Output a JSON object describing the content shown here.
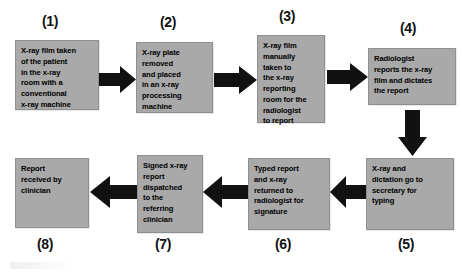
{
  "diagram": {
    "box_fill_color": "#a9a9a9",
    "box_border_color": "#8f8f8f",
    "arrow_color": "#111111",
    "background_color": "#ffffff",
    "nodes": [
      {
        "number": "(1)",
        "text": "X-ray film taken\nof the patient\nin the x-ray\nroom with a\nconventional\nx-ray machine",
        "x": 15,
        "y": 40,
        "w": 84,
        "h": 70,
        "label_x": 42,
        "label_y": 13
      },
      {
        "number": "(2)",
        "text": "X-ray plate\nremoved\nand placed\nin an x-ray\nprocessing\nmachine",
        "x": 136,
        "y": 42,
        "w": 77,
        "h": 71,
        "label_x": 160,
        "label_y": 14
      },
      {
        "number": "(3)",
        "text": "X-ray film\nmanually\ntaken to\nthe x-ray\nreporting\nroom for the\nradiologist\nto report",
        "x": 257,
        "y": 35,
        "w": 68,
        "h": 88,
        "label_x": 279,
        "label_y": 8
      },
      {
        "number": "(4)",
        "text": "Radiologist\nreports the x-ray\nfilm and dictates\nthe report",
        "x": 368,
        "y": 48,
        "w": 88,
        "h": 57,
        "label_x": 400,
        "label_y": 20
      },
      {
        "number": "(5)",
        "text": "X-ray and\ndictation go to\nsecretary for\ntyping",
        "x": 366,
        "y": 158,
        "w": 88,
        "h": 72,
        "label_x": 398,
        "label_y": 236
      },
      {
        "number": "(6)",
        "text": "Typed report\nand x-ray\nreturned to\nradiologist for\nsignature",
        "x": 248,
        "y": 158,
        "w": 82,
        "h": 72,
        "label_x": 275,
        "label_y": 236
      },
      {
        "number": "(7)",
        "text": "Signed x-ray\nreport\ndispatched\nto the\nreferring\nclinician",
        "x": 137,
        "y": 155,
        "w": 66,
        "h": 78,
        "label_x": 155,
        "label_y": 236
      },
      {
        "number": "(8)",
        "text": "Report\nreceived by\nclinician",
        "x": 15,
        "y": 158,
        "w": 74,
        "h": 70,
        "label_x": 37,
        "label_y": 236
      }
    ],
    "arrows": [
      {
        "name": "arrow-1-to-2",
        "direction": "right",
        "x": 99,
        "y": 66,
        "w": 37,
        "h": 27
      },
      {
        "name": "arrow-2-to-3",
        "direction": "right",
        "x": 214,
        "y": 66,
        "w": 43,
        "h": 28
      },
      {
        "name": "arrow-3-to-4",
        "direction": "right",
        "x": 327,
        "y": 63,
        "w": 41,
        "h": 28
      },
      {
        "name": "arrow-4-to-5",
        "direction": "down",
        "x": 398,
        "y": 110,
        "w": 29,
        "h": 46
      },
      {
        "name": "arrow-5-to-6",
        "direction": "left",
        "x": 330,
        "y": 176,
        "w": 36,
        "h": 32
      },
      {
        "name": "arrow-6-to-7",
        "direction": "left",
        "x": 203,
        "y": 176,
        "w": 45,
        "h": 32
      },
      {
        "name": "arrow-7-to-8",
        "direction": "left",
        "x": 90,
        "y": 176,
        "w": 47,
        "h": 32
      }
    ]
  }
}
